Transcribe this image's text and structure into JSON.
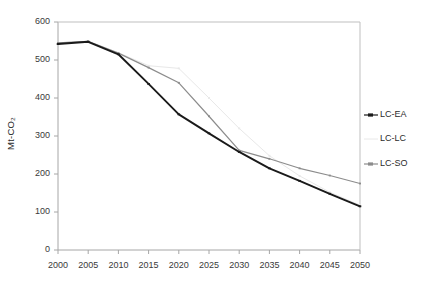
{
  "chart_data": {
    "type": "line",
    "title": "",
    "xlabel": "",
    "ylabel": "Mt-CO2",
    "ylabel_display": "Mt-CO₂",
    "x": [
      2000,
      2005,
      2010,
      2015,
      2020,
      2025,
      2030,
      2035,
      2040,
      2045,
      2050
    ],
    "xlim": [
      2000,
      2050
    ],
    "ylim": [
      0,
      600
    ],
    "ytick_labels": [
      "0",
      "100",
      "200",
      "300",
      "400",
      "500",
      "600"
    ],
    "yticks": [
      0,
      100,
      200,
      300,
      400,
      500,
      600
    ],
    "xtick_labels": [
      "2000",
      "2005",
      "2010",
      "2015",
      "2020",
      "2025",
      "2030",
      "2035",
      "2040",
      "2045",
      "2050"
    ],
    "grid": false,
    "legend_position": "right",
    "series": [
      {
        "name": "LC-EA",
        "color": "#1a1a1a",
        "values": [
          542,
          548,
          515,
          437,
          357,
          307,
          258,
          215,
          182,
          148,
          115
        ]
      },
      {
        "name": "LC-LC",
        "color": "#e8e8e8",
        "values": [
          545,
          549,
          519,
          485,
          478,
          400,
          320,
          248,
          195,
          152,
          118
        ]
      },
      {
        "name": "LC-SO",
        "color": "#8c8c8c",
        "values": [
          545,
          549,
          518,
          480,
          440,
          352,
          262,
          240,
          215,
          196,
          175
        ]
      }
    ]
  },
  "legend": {
    "items": [
      {
        "label": "LC-EA",
        "marker": "line-marker-dark"
      },
      {
        "label": "LC-LC",
        "marker": "line-marker-light"
      },
      {
        "label": "LC-SO",
        "marker": "line-marker-gray"
      }
    ]
  },
  "colors": {
    "axis": "#a6a6a6",
    "frame": "#bfbfbf",
    "text": "#2b2b2b",
    "series_ea": "#1a1a1a",
    "series_lc": "#e8e8e8",
    "series_so": "#8c8c8c"
  }
}
